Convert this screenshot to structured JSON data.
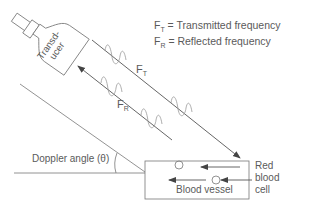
{
  "legend": {
    "ft_symbol": "F",
    "ft_sub": "T",
    "ft_text": " = Transmitted frequency",
    "fr_symbol": "F",
    "fr_sub": "R",
    "fr_text": " = Reflected frequency"
  },
  "transducer": {
    "line1": "Transd-",
    "line2": "ucer"
  },
  "beam_labels": {
    "transmitted_symbol": "F",
    "transmitted_sub": "T",
    "reflected_symbol": "F",
    "reflected_sub": "R"
  },
  "angle_label": "Doppler angle (θ)",
  "vessel_label": "Blood vessel",
  "rbc_label": {
    "line1": "Red",
    "line2": "blood",
    "line3": "cell"
  },
  "colors": {
    "stroke": "#666666",
    "wave": "#888888",
    "text": "#5a5a5a"
  }
}
